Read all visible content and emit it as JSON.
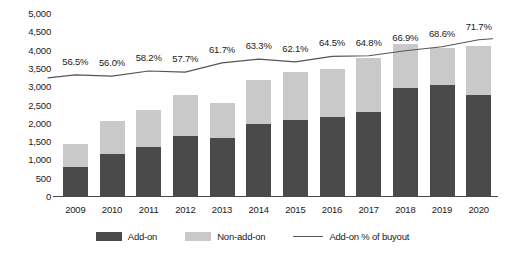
{
  "chart_data": {
    "type": "bar",
    "title": "",
    "subtitle": "",
    "xlabel": "",
    "ylabel": "",
    "ylim": [
      0,
      5000
    ],
    "ytick_step": 500,
    "grid": false,
    "legend_position": "bottom",
    "stacked": true,
    "categories": [
      "2009",
      "2010",
      "2011",
      "2012",
      "2013",
      "2014",
      "2015",
      "2016",
      "2017",
      "2018",
      "2019",
      "2020"
    ],
    "ytick_labels": [
      "5,000",
      "4,500",
      "4,000",
      "3,500",
      "3,000",
      "2,500",
      "2,000",
      "1,500",
      "1,000",
      "500",
      "0"
    ],
    "ytick_values": [
      5000,
      4500,
      4000,
      3500,
      3000,
      2500,
      2000,
      1500,
      1000,
      500,
      0
    ],
    "series": [
      {
        "name": "Add-on",
        "color": "#4a4a4a",
        "values": [
          800,
          1150,
          1350,
          1650,
          1580,
          1960,
          2080,
          2150,
          2300,
          2950,
          3020,
          2750
        ]
      },
      {
        "name": "Non-add-on",
        "color": "#c9c9c9",
        "values": [
          610,
          900,
          1000,
          1100,
          960,
          1220,
          1320,
          1320,
          1460,
          1200,
          1030,
          1350
        ]
      }
    ],
    "totals": [
      1410,
      2050,
      2350,
      2750,
      2540,
      3180,
      3400,
      3470,
      3760,
      4150,
      4050,
      4100
    ],
    "line_series": {
      "name": "Add-on % of buyout",
      "color": "#555555",
      "axis": "secondary",
      "value_labels": [
        "56.5%",
        "56.0%",
        "58.2%",
        "57.7%",
        "61.7%",
        "63.3%",
        "62.1%",
        "64.5%",
        "64.8%",
        "66.9%",
        "68.6%",
        "71.7%"
      ],
      "values": [
        56.5,
        56.0,
        58.2,
        57.7,
        61.7,
        63.3,
        62.1,
        64.5,
        64.8,
        66.9,
        68.6,
        71.7
      ]
    },
    "legend": [
      {
        "label": "Add-on",
        "type": "swatch-dark"
      },
      {
        "label": "Non-add-on",
        "type": "swatch-light"
      },
      {
        "label": "Add-on % of buyout",
        "type": "line"
      }
    ]
  }
}
